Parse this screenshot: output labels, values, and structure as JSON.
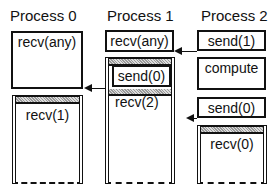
{
  "headers": [
    "Process 0",
    "Process 1",
    "Process 2"
  ],
  "process0": {
    "box1": "recv(any)",
    "box2": "recv(1)"
  },
  "process1": {
    "box1": "recv(any)",
    "inner": "send(0)",
    "box2": "recv(2)"
  },
  "process2": {
    "box1": "send(1)",
    "box2": "compute",
    "box3": "send(0)",
    "box4": "recv(0)"
  },
  "arrows": [
    {
      "from": "process2.send(1)",
      "to": "process1.recv(any)"
    },
    {
      "from": "process1.send(0)",
      "to": "process0.recv(any)"
    },
    {
      "from": "process2.send(0)",
      "to": "process1.recv(2)"
    }
  ]
}
